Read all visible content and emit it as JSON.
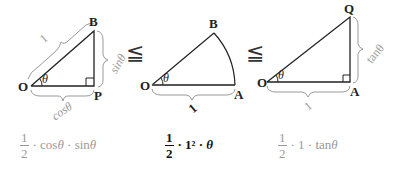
{
  "diagram": {
    "triangle_opb": {
      "vertices": {
        "O": "O",
        "B": "B",
        "P": "P"
      },
      "angle": "θ",
      "labels": {
        "hypotenuse": "1",
        "vertical": "sinθ",
        "horizontal": "cosθ"
      }
    },
    "relation_1": "≦",
    "sector_oab": {
      "vertices": {
        "O": "O",
        "B": "B",
        "A": "A"
      },
      "angle": "θ",
      "labels": {
        "radius": "1"
      }
    },
    "relation_2": "≦",
    "triangle_oaq": {
      "vertices": {
        "O": "O",
        "Q": "Q",
        "A": "A"
      },
      "angle": "θ",
      "labels": {
        "vertical": "tanθ",
        "horizontal": "1"
      }
    }
  },
  "formulas": {
    "triangle_area": {
      "num": "1",
      "den": "2",
      "rest_a": "· cos",
      "theta_a": "θ",
      "rest_b": " · sin",
      "theta_b": "θ"
    },
    "sector_area": {
      "num": "1",
      "den": "2",
      "rest_a": "· 1² · ",
      "theta_a": "θ"
    },
    "big_triangle_area": {
      "num": "1",
      "den": "2",
      "rest_a": "· 1 · tan",
      "theta_a": "θ"
    }
  },
  "colors": {
    "line": "#222222",
    "brace": "#999999",
    "grey_text": "#9a9a9a"
  }
}
